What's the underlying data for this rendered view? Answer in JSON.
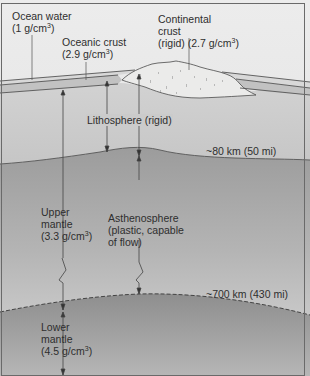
{
  "diagram": {
    "colors": {
      "ocean_water_zone": "#e4e4e4",
      "water_band": "#d6d6d6",
      "oceanic_crust": "#c4c4c4",
      "continental_crust": "#e8e8e6",
      "lithosphere": "#cbcbcb",
      "asthenosphere_top": "#9e9e9e",
      "asthenosphere_bottom": "#d8d8d8",
      "lower_mantle_top": "#8f8f8f",
      "lower_mantle_bottom": "#b2b2b2",
      "line": "#4a4a4a",
      "text": "#2e2e2e"
    },
    "labels": {
      "ocean_water": {
        "line1": "Ocean water",
        "line2_prefix": "(1 g/cm",
        "sup": "3",
        "line2_suffix": ")"
      },
      "oceanic_crust": {
        "line1": "Oceanic crust",
        "line2_prefix": "(2.9 g/cm",
        "sup": "3",
        "line2_suffix": ")"
      },
      "continental_crust": {
        "line1": "Continental",
        "line2": "crust",
        "line3_prefix": "(rigid) (2.7 g/cm",
        "sup": "3",
        "line3_suffix": ")"
      },
      "lithosphere": "Lithosphere (rigid)",
      "depth_80": "~80 km (50 mi)",
      "upper_mantle": {
        "line1": "Upper",
        "line2": "mantle",
        "line3_prefix": "(3.3 g/cm",
        "sup": "3",
        "line3_suffix": ")"
      },
      "asthenosphere": {
        "line1": "Asthenosphere",
        "line2": "(plastic, capable",
        "line3": "of flow)"
      },
      "depth_700": "~700 km (430 mi)",
      "lower_mantle": {
        "line1": "Lower",
        "line2": "mantle",
        "line3_prefix": "(4.5 g/cm",
        "sup": "3",
        "line3_suffix": ")"
      }
    }
  }
}
